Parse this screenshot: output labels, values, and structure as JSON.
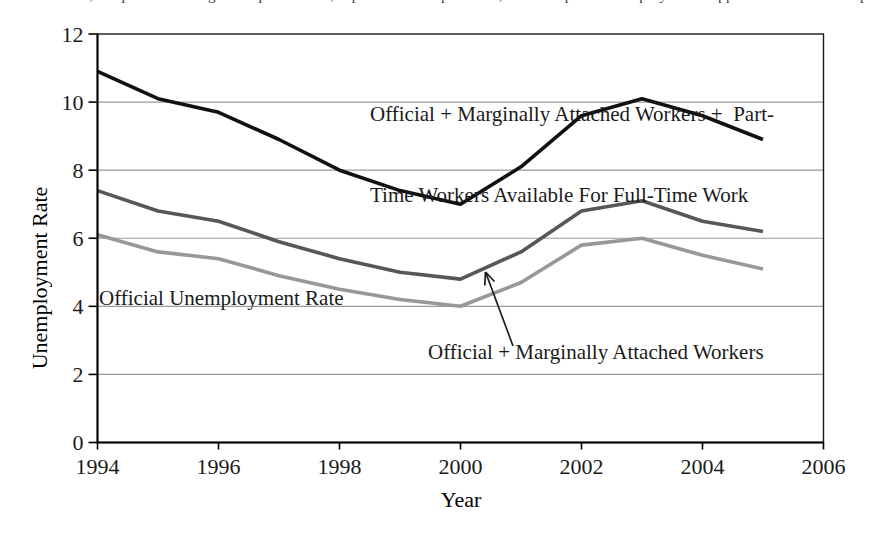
{
  "page": {
    "top_clipped_text": "accumulation, improved storage of perishables, speedier transportation, and improved employment opportunities in the population at large"
  },
  "chart_data": {
    "type": "line",
    "title": "",
    "xlabel": "Year",
    "ylabel": "Unemployment Rate",
    "xlim": [
      1994,
      2006
    ],
    "ylim": [
      0,
      12
    ],
    "x_ticks": [
      1994,
      1996,
      1998,
      2000,
      2002,
      2004,
      2006
    ],
    "y_ticks": [
      0,
      2,
      4,
      6,
      8,
      10,
      12
    ],
    "grid": "horizontal gridlines at each y tick",
    "legend_position": "in-plot text annotations",
    "x": [
      1994,
      1995,
      1996,
      1997,
      1998,
      1999,
      2000,
      2001,
      2002,
      2003,
      2004,
      2005
    ],
    "series": [
      {
        "name": "official-plus-marginal-plus-parttime",
        "color": "#111111",
        "values": [
          10.9,
          10.1,
          9.7,
          8.9,
          8.0,
          7.4,
          7.0,
          8.1,
          9.6,
          10.1,
          9.6,
          8.9
        ]
      },
      {
        "name": "official-plus-marginal",
        "color": "#575757",
        "values": [
          7.4,
          6.8,
          6.5,
          5.9,
          5.4,
          5.0,
          4.8,
          5.6,
          6.8,
          7.1,
          6.5,
          6.2
        ]
      },
      {
        "name": "official",
        "color": "#989898",
        "values": [
          6.1,
          5.6,
          5.4,
          4.9,
          4.5,
          4.2,
          4.0,
          4.7,
          5.8,
          6.0,
          5.5,
          5.1
        ]
      }
    ],
    "annotations": [
      {
        "for_series": "official-plus-marginal-plus-parttime",
        "text_line1": "Official + Marginally Attached Workers +  Part-",
        "text_line2": "Time Workers Available For Full-Time Work"
      },
      {
        "for_series": "official",
        "text": "Official Unemployment Rate"
      },
      {
        "for_series": "official-plus-marginal",
        "text": "Official + Marginally Attached Workers",
        "arrow": "points from label up to the series line between 2000 and 2001"
      }
    ],
    "colors": {
      "series_top": "#111111",
      "series_mid": "#575757",
      "series_bottom": "#989898",
      "gridline": "#9b9b9b",
      "axis": "#000000"
    }
  }
}
